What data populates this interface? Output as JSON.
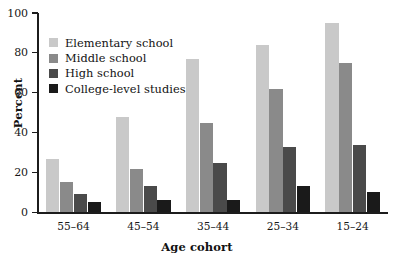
{
  "chart_data": {
    "type": "bar",
    "title": "",
    "xlabel": "Age cohort",
    "ylabel": "Percent",
    "ylim": [
      0,
      100
    ],
    "yticks": [
      0,
      20,
      40,
      60,
      80,
      100
    ],
    "grid": false,
    "legend_position": "inside-top-left",
    "categories": [
      "55–64",
      "45–54",
      "35–44",
      "25–34",
      "15–24"
    ],
    "series": [
      {
        "name": "Elementary school",
        "color": "#c9c9c9",
        "values": [
          27,
          48,
          77,
          84,
          95
        ]
      },
      {
        "name": "Middle school",
        "color": "#8a8a8a",
        "values": [
          15,
          22,
          45,
          62,
          75
        ]
      },
      {
        "name": "High school",
        "color": "#4a4a4a",
        "values": [
          9,
          13,
          25,
          33,
          34
        ]
      },
      {
        "name": "College-level studies",
        "color": "#1a1a1a",
        "values": [
          5,
          6,
          6,
          13,
          10
        ]
      }
    ]
  },
  "axis": {
    "y_title": "Percent",
    "x_title": "Age cohort",
    "y_tick_labels": [
      "100",
      "80",
      "60",
      "40",
      "20",
      "0"
    ],
    "x_tick_labels": [
      "55–64",
      "45–54",
      "35–44",
      "25–34",
      "15–24"
    ]
  },
  "legend": {
    "items": [
      {
        "label": "Elementary school",
        "color": "#c9c9c9"
      },
      {
        "label": "Middle school",
        "color": "#8a8a8a"
      },
      {
        "label": "High school",
        "color": "#4a4a4a"
      },
      {
        "label": "College-level studies",
        "color": "#1a1a1a"
      }
    ]
  }
}
